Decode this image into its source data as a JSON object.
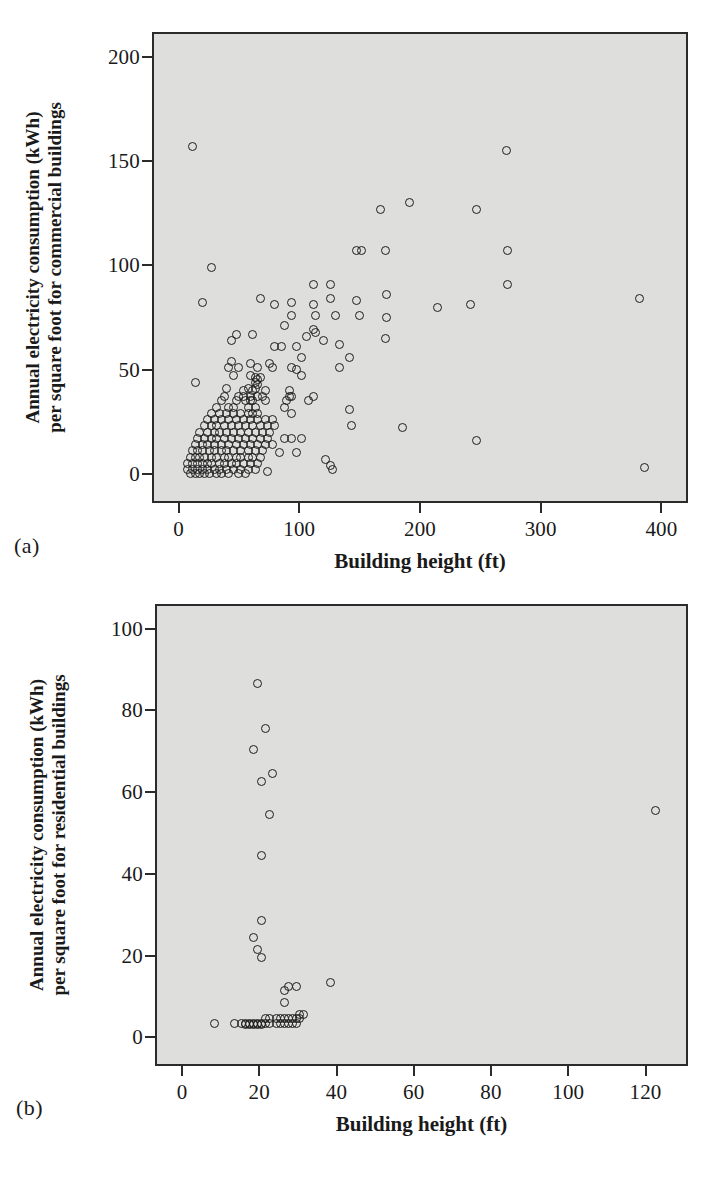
{
  "figure": {
    "background_color": "#ffffff",
    "plot_background_color": "#dededd",
    "axis_color": "#2b2b2b",
    "marker_color": "#1d1d1d"
  },
  "panel_a": {
    "panel_label": "(a)",
    "chart_data": {
      "type": "scatter",
      "title": "",
      "xlabel": "Building height (ft)",
      "ylabel": "Annual electricity consumption (kWh) per square foot for commercial buildings",
      "ylabel_line1": "Annual electricity consumption (kWh)",
      "ylabel_line2": "per square foot for commercial buildings",
      "xticks": [
        0,
        100,
        200,
        300,
        400
      ],
      "yticks": [
        0,
        50,
        100,
        150,
        200
      ],
      "xlim": [
        -22,
        422
      ],
      "ylim": [
        -14,
        212
      ],
      "grid": false,
      "legend": "none",
      "marker": "open-circle",
      "series": [
        {
          "name": "Commercial buildings",
          "points": [
            [
              10,
              158
            ],
            [
              270,
              156
            ],
            [
              166,
              128
            ],
            [
              190,
              131
            ],
            [
              245,
              128
            ],
            [
              146,
              108
            ],
            [
              150,
              108
            ],
            [
              170,
              108
            ],
            [
              271,
              108
            ],
            [
              26,
              100
            ],
            [
              271,
              92
            ],
            [
              110,
              92
            ],
            [
              124,
              92
            ],
            [
              66,
              85
            ],
            [
              124,
              85
            ],
            [
              146,
              84
            ],
            [
              171,
              87
            ],
            [
              380,
              85
            ],
            [
              18,
              83
            ],
            [
              78,
              82
            ],
            [
              92,
              83
            ],
            [
              110,
              82
            ],
            [
              92,
              77
            ],
            [
              112,
              77
            ],
            [
              128,
              77
            ],
            [
              148,
              77
            ],
            [
              171,
              76
            ],
            [
              213,
              81
            ],
            [
              240,
              82
            ],
            [
              86,
              72
            ],
            [
              104,
              67
            ],
            [
              110,
              70
            ],
            [
              112,
              69
            ],
            [
              60,
              68
            ],
            [
              42,
              65
            ],
            [
              46,
              68
            ],
            [
              118,
              65
            ],
            [
              132,
              63
            ],
            [
              170,
              66
            ],
            [
              78,
              62
            ],
            [
              84,
              62
            ],
            [
              96,
              62
            ],
            [
              100,
              57
            ],
            [
              42,
              55
            ],
            [
              58,
              54
            ],
            [
              74,
              54
            ],
            [
              140,
              57
            ],
            [
              40,
              52
            ],
            [
              48,
              52
            ],
            [
              64,
              52
            ],
            [
              76,
              52
            ],
            [
              92,
              52
            ],
            [
              96,
              51
            ],
            [
              132,
              52
            ],
            [
              44,
              48
            ],
            [
              58,
              48
            ],
            [
              62,
              47
            ],
            [
              64,
              46
            ],
            [
              66,
              47
            ],
            [
              100,
              48
            ],
            [
              62,
              45
            ],
            [
              64,
              44
            ],
            [
              12,
              45
            ],
            [
              38,
              42
            ],
            [
              52,
              41
            ],
            [
              56,
              42
            ],
            [
              60,
              41
            ],
            [
              62,
              42
            ],
            [
              70,
              41
            ],
            [
              90,
              41
            ],
            [
              36,
              38
            ],
            [
              48,
              38
            ],
            [
              52,
              38
            ],
            [
              58,
              38
            ],
            [
              64,
              38
            ],
            [
              68,
              38
            ],
            [
              90,
              38
            ],
            [
              92,
              38
            ],
            [
              110,
              38
            ],
            [
              34,
              36
            ],
            [
              46,
              36
            ],
            [
              54,
              36
            ],
            [
              58,
              36
            ],
            [
              60,
              36
            ],
            [
              70,
              36
            ],
            [
              88,
              36
            ],
            [
              106,
              36
            ],
            [
              30,
              33
            ],
            [
              40,
              33
            ],
            [
              44,
              33
            ],
            [
              56,
              33
            ],
            [
              62,
              33
            ],
            [
              86,
              33
            ],
            [
              140,
              32
            ],
            [
              26,
              30
            ],
            [
              32,
              30
            ],
            [
              38,
              30
            ],
            [
              44,
              30
            ],
            [
              50,
              30
            ],
            [
              56,
              30
            ],
            [
              60,
              30
            ],
            [
              64,
              30
            ],
            [
              92,
              30
            ],
            [
              22,
              27
            ],
            [
              28,
              27
            ],
            [
              34,
              27
            ],
            [
              40,
              27
            ],
            [
              46,
              27
            ],
            [
              52,
              27
            ],
            [
              58,
              27
            ],
            [
              64,
              27
            ],
            [
              70,
              27
            ],
            [
              76,
              27
            ],
            [
              20,
              24
            ],
            [
              26,
              24
            ],
            [
              30,
              24
            ],
            [
              36,
              24
            ],
            [
              42,
              24
            ],
            [
              48,
              24
            ],
            [
              54,
              24
            ],
            [
              60,
              24
            ],
            [
              66,
              24
            ],
            [
              72,
              24
            ],
            [
              78,
              24
            ],
            [
              142,
              24
            ],
            [
              184,
              23
            ],
            [
              16,
              21
            ],
            [
              22,
              21
            ],
            [
              28,
              21
            ],
            [
              32,
              21
            ],
            [
              38,
              21
            ],
            [
              44,
              21
            ],
            [
              50,
              21
            ],
            [
              56,
              21
            ],
            [
              62,
              21
            ],
            [
              68,
              21
            ],
            [
              74,
              21
            ],
            [
              14,
              18
            ],
            [
              20,
              18
            ],
            [
              26,
              18
            ],
            [
              30,
              18
            ],
            [
              36,
              18
            ],
            [
              42,
              18
            ],
            [
              48,
              18
            ],
            [
              54,
              18
            ],
            [
              60,
              18
            ],
            [
              66,
              18
            ],
            [
              72,
              18
            ],
            [
              86,
              18
            ],
            [
              92,
              18
            ],
            [
              100,
              18
            ],
            [
              245,
              17
            ],
            [
              12,
              15
            ],
            [
              18,
              15
            ],
            [
              22,
              15
            ],
            [
              28,
              15
            ],
            [
              34,
              15
            ],
            [
              40,
              15
            ],
            [
              46,
              15
            ],
            [
              52,
              15
            ],
            [
              58,
              15
            ],
            [
              64,
              15
            ],
            [
              70,
              15
            ],
            [
              76,
              15
            ],
            [
              10,
              12
            ],
            [
              14,
              12
            ],
            [
              18,
              12
            ],
            [
              24,
              12
            ],
            [
              28,
              12
            ],
            [
              34,
              12
            ],
            [
              38,
              12
            ],
            [
              44,
              12
            ],
            [
              50,
              12
            ],
            [
              56,
              12
            ],
            [
              62,
              12
            ],
            [
              68,
              12
            ],
            [
              82,
              11
            ],
            [
              96,
              11
            ],
            [
              8,
              9
            ],
            [
              12,
              9
            ],
            [
              16,
              9
            ],
            [
              20,
              9
            ],
            [
              26,
              9
            ],
            [
              30,
              9
            ],
            [
              36,
              9
            ],
            [
              40,
              9
            ],
            [
              46,
              9
            ],
            [
              50,
              9
            ],
            [
              56,
              9
            ],
            [
              60,
              9
            ],
            [
              66,
              9
            ],
            [
              120,
              8
            ],
            [
              6,
              6
            ],
            [
              10,
              6
            ],
            [
              14,
              6
            ],
            [
              18,
              6
            ],
            [
              22,
              6
            ],
            [
              26,
              6
            ],
            [
              32,
              6
            ],
            [
              36,
              6
            ],
            [
              42,
              6
            ],
            [
              46,
              6
            ],
            [
              52,
              6
            ],
            [
              58,
              6
            ],
            [
              64,
              6
            ],
            [
              124,
              5
            ],
            [
              384,
              4
            ],
            [
              6,
              3
            ],
            [
              10,
              3
            ],
            [
              14,
              3
            ],
            [
              18,
              3
            ],
            [
              22,
              3
            ],
            [
              28,
              3
            ],
            [
              32,
              3
            ],
            [
              38,
              3
            ],
            [
              44,
              3
            ],
            [
              50,
              3
            ],
            [
              56,
              3
            ],
            [
              62,
              3
            ],
            [
              72,
              2
            ],
            [
              126,
              3
            ],
            [
              8,
              1
            ],
            [
              12,
              1
            ],
            [
              16,
              1
            ],
            [
              20,
              1
            ],
            [
              24,
              1
            ],
            [
              30,
              1
            ],
            [
              34,
              1
            ],
            [
              40,
              1
            ],
            [
              48,
              1
            ],
            [
              54,
              1
            ]
          ]
        }
      ]
    }
  },
  "panel_b": {
    "panel_label": "(b)",
    "chart_data": {
      "type": "scatter",
      "title": "",
      "xlabel": "Building height (ft)",
      "ylabel": "Annual electricity consumption (kWh) per square foot for residential buildings",
      "ylabel_line1": "Annual electricity consumption (kWh)",
      "ylabel_line2": "per square foot for residential buildings",
      "xticks": [
        0,
        20,
        40,
        60,
        80,
        100,
        120
      ],
      "yticks": [
        0,
        20,
        40,
        60,
        80,
        100
      ],
      "xlim": [
        -7,
        131
      ],
      "ylim": [
        -7,
        106
      ],
      "grid": false,
      "legend": "none",
      "marker": "open-circle",
      "series": [
        {
          "name": "Residential buildings",
          "points": [
            [
              19,
              87
            ],
            [
              21,
              76
            ],
            [
              18,
              71
            ],
            [
              20,
              63
            ],
            [
              23,
              65
            ],
            [
              22,
              55
            ],
            [
              20,
              45
            ],
            [
              20,
              29
            ],
            [
              18,
              25
            ],
            [
              19,
              22
            ],
            [
              20,
              20
            ],
            [
              38,
              14
            ],
            [
              27,
              13
            ],
            [
              29,
              13
            ],
            [
              26,
              12
            ],
            [
              26,
              9
            ],
            [
              8,
              4
            ],
            [
              13,
              4
            ],
            [
              15,
              4
            ],
            [
              16,
              4
            ],
            [
              16,
              3.6
            ],
            [
              17,
              4
            ],
            [
              17,
              3.6
            ],
            [
              18,
              4
            ],
            [
              18,
              3.6
            ],
            [
              19,
              4
            ],
            [
              19,
              3.6
            ],
            [
              20,
              4
            ],
            [
              20,
              3.6
            ],
            [
              21,
              5
            ],
            [
              21,
              4
            ],
            [
              22,
              5
            ],
            [
              22,
              4
            ],
            [
              24,
              5
            ],
            [
              24,
              4
            ],
            [
              25,
              5
            ],
            [
              25,
              4
            ],
            [
              26,
              5
            ],
            [
              26,
              4
            ],
            [
              27,
              5
            ],
            [
              27,
              4
            ],
            [
              28,
              5
            ],
            [
              28,
              4
            ],
            [
              29,
              5
            ],
            [
              29,
              4
            ],
            [
              30,
              6
            ],
            [
              30,
              5
            ],
            [
              31,
              6
            ],
            [
              122,
              56
            ]
          ]
        }
      ]
    }
  }
}
